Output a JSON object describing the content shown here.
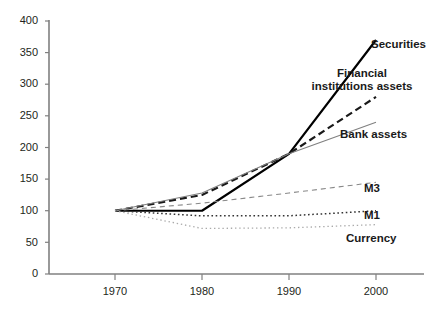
{
  "chart_data": {
    "type": "line",
    "title": "",
    "xlabel": "",
    "ylabel": "",
    "x": [
      1970,
      1980,
      1990,
      2000
    ],
    "categories": [
      "1970",
      "1980",
      "1990",
      "2000"
    ],
    "xlim": [
      1965,
      2005
    ],
    "ylim": [
      0,
      400
    ],
    "ytick_labels": [
      "0",
      "50",
      "100",
      "150",
      "200",
      "250",
      "300",
      "350",
      "400"
    ],
    "ytick_values": [
      0,
      50,
      100,
      150,
      200,
      250,
      300,
      350,
      400
    ],
    "xtick_labels": [
      "1970",
      "1980",
      "1990",
      "2000"
    ],
    "grid": false,
    "legend_position": "inline-right-of-line-ends",
    "series": [
      {
        "name": "Securities",
        "values": [
          100,
          100,
          190,
          370
        ],
        "style": "solid",
        "color": "#000000",
        "width": 2.2
      },
      {
        "name": "Financial institutions assets",
        "values": [
          100,
          125,
          190,
          280
        ],
        "style": "dashed",
        "color": "#1a1a1a",
        "width": 2.2
      },
      {
        "name": "Bank assets",
        "values": [
          100,
          128,
          190,
          240
        ],
        "style": "solid",
        "color": "#808080",
        "width": 1.1
      },
      {
        "name": "M3",
        "values": [
          100,
          112,
          128,
          145
        ],
        "style": "dashed",
        "color": "#888888",
        "width": 1.1
      },
      {
        "name": "M1",
        "values": [
          100,
          92,
          92,
          100
        ],
        "style": "dotted",
        "color": "#333333",
        "width": 1.5
      },
      {
        "name": "Currency",
        "values": [
          100,
          72,
          73,
          78
        ],
        "style": "dotted",
        "color": "#aaaaaa",
        "width": 1.3
      }
    ]
  },
  "axes": {
    "y_ticks": [
      {
        "label": "400"
      },
      {
        "label": "350"
      },
      {
        "label": "300"
      },
      {
        "label": "250"
      },
      {
        "label": "200"
      },
      {
        "label": "150"
      },
      {
        "label": "100"
      },
      {
        "label": "50"
      },
      {
        "label": "0"
      }
    ],
    "x_ticks": [
      {
        "label": "1970"
      },
      {
        "label": "1980"
      },
      {
        "label": "1990"
      },
      {
        "label": "2000"
      }
    ]
  },
  "labels": {
    "securities": "Securities",
    "financial_institutions_assets_line1": "Financial",
    "financial_institutions_assets_line2": "institutions assets",
    "bank_assets": "Bank assets",
    "m3": "M3",
    "m1": "M1",
    "currency": "Currency"
  },
  "colors": {
    "axis": "#808080",
    "text": "#231f20",
    "securities": "#000000",
    "financial_institutions_assets": "#1a1a1a",
    "bank_assets": "#808080",
    "m3": "#888888",
    "m1": "#333333",
    "currency": "#aaaaaa"
  }
}
